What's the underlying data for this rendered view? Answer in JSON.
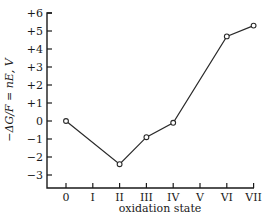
{
  "chart_data": {
    "type": "line",
    "title": "",
    "xlabel": "oxidation state",
    "ylabel": "−ΔG/F = nE, V",
    "categories": [
      "0",
      "I",
      "II",
      "III",
      "IV",
      "V",
      "VI",
      "VII"
    ],
    "series": [
      {
        "name": "Frost diagram",
        "x": [
          "0",
          "II",
          "III",
          "IV",
          "VI",
          "VII"
        ],
        "values": [
          0,
          -2.4,
          -0.9,
          -0.1,
          4.7,
          5.3
        ]
      }
    ],
    "yticks": [
      "+6",
      "+5",
      "+4",
      "+3",
      "+2",
      "+1",
      "0",
      "−1",
      "−2",
      "−3"
    ],
    "ytick_values": [
      6,
      5,
      4,
      3,
      2,
      1,
      0,
      -1,
      -2,
      -3
    ],
    "ylim": [
      -3.7,
      6
    ],
    "grid": false,
    "legend": null,
    "markers": "open-circle"
  }
}
